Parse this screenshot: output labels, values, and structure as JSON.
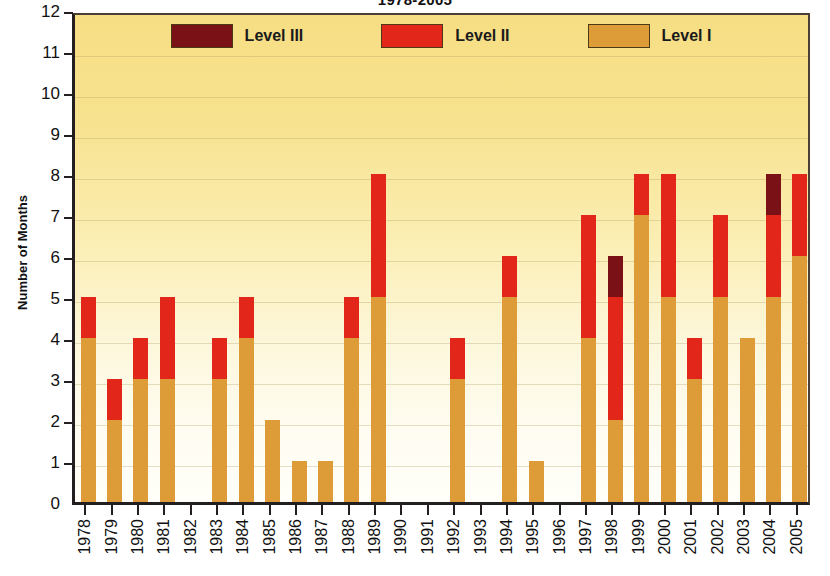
{
  "chart_data": {
    "type": "bar",
    "title": "1978-2005",
    "xlabel": "",
    "ylabel": "Number of Months",
    "ylim": [
      0,
      12
    ],
    "ytick_labels": [
      "0",
      "1",
      "2",
      "3",
      "4",
      "5",
      "6",
      "7",
      "8",
      "9",
      "10",
      "11",
      "12"
    ],
    "grid": true,
    "stacked": true,
    "legend_position": "top-center",
    "categories": [
      "1978",
      "1979",
      "1980",
      "1981",
      "1982",
      "1983",
      "1984",
      "1985",
      "1986",
      "1987",
      "1988",
      "1989",
      "1990",
      "1991",
      "1992",
      "1993",
      "1994",
      "1995",
      "1996",
      "1997",
      "1998",
      "1999",
      "2000",
      "2001",
      "2002",
      "2003",
      "2004",
      "2005"
    ],
    "series": [
      {
        "name": "Level I",
        "color": "#dd9c37",
        "values": [
          4,
          2,
          3,
          3,
          0,
          3,
          4,
          2,
          1,
          1,
          4,
          5,
          0,
          0,
          3,
          0,
          5,
          1,
          0,
          4,
          2,
          7,
          5,
          3,
          5,
          4,
          5,
          6
        ]
      },
      {
        "name": "Level II",
        "color": "#e3261a",
        "values": [
          1,
          1,
          1,
          2,
          0,
          1,
          1,
          0,
          0,
          0,
          1,
          3,
          0,
          0,
          1,
          0,
          1,
          0,
          0,
          3,
          3,
          1,
          3,
          1,
          2,
          0,
          2,
          2
        ]
      },
      {
        "name": "Level III",
        "color": "#7a1117",
        "values": [
          0,
          0,
          0,
          0,
          0,
          0,
          0,
          0,
          0,
          0,
          0,
          0,
          0,
          0,
          0,
          0,
          0,
          0,
          0,
          0,
          1,
          0,
          0,
          0,
          0,
          0,
          1,
          0
        ]
      }
    ],
    "totals": [
      5,
      3,
      4,
      5,
      0,
      4,
      5,
      2,
      1,
      1,
      5,
      8,
      0,
      0,
      4,
      0,
      6,
      1,
      0,
      7,
      6,
      8,
      8,
      4,
      7,
      4,
      8,
      8
    ]
  },
  "legend": {
    "items": [
      {
        "label": "Level III",
        "color": "#7a1117"
      },
      {
        "label": "Level II",
        "color": "#e3261a"
      },
      {
        "label": "Level I",
        "color": "#dd9c37"
      }
    ]
  },
  "colors": {
    "level_1": "#dd9c37",
    "level_2": "#e3261a",
    "level_3": "#7a1117",
    "plot_background_top": "#f6de84",
    "plot_background_bottom": "#fffef8",
    "axis": "#231f20"
  }
}
